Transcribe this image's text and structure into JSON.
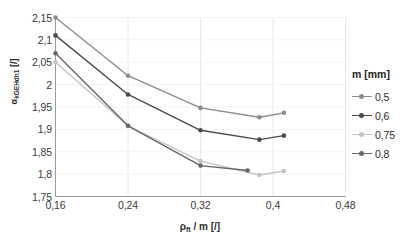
{
  "chart_data": {
    "type": "line",
    "title": "",
    "xlabel": "ρft / m [/]",
    "xlabel_base": "ρ",
    "xlabel_sub": "ft",
    "xlabel_rest": " / m [/]",
    "ylabel": "αkGEHdh1 [/]",
    "ylabel_base": "α",
    "ylabel_sub": "kGEHdh1",
    "ylabel_rest": " [/]",
    "xlim": [
      0.16,
      0.48
    ],
    "ylim": [
      1.75,
      2.15
    ],
    "xticks": [
      0.16,
      0.24,
      0.32,
      0.4,
      0.48
    ],
    "xtick_labels": [
      "0,16",
      "0,24",
      "0,32",
      "0,4",
      "0,48"
    ],
    "yticks": [
      1.75,
      1.8,
      1.85,
      1.9,
      1.95,
      2.0,
      2.05,
      2.1,
      2.15
    ],
    "ytick_labels": [
      "1,75",
      "1,8",
      "1,85",
      "1,9",
      "1,95",
      "2",
      "2,05",
      "2,1",
      "2,15"
    ],
    "grid": true,
    "grid_color": "#e8e8e8",
    "legend_position": "right",
    "legend_title": "m [mm]",
    "series": [
      {
        "name": "0,5",
        "color": "#8c8c8c",
        "x": [
          0.16,
          0.24,
          0.32,
          0.385,
          0.412
        ],
        "y": [
          2.15,
          2.02,
          1.948,
          1.927,
          1.937
        ]
      },
      {
        "name": "0,6",
        "color": "#4a4a4a",
        "x": [
          0.16,
          0.24,
          0.32,
          0.385,
          0.412
        ],
        "y": [
          2.11,
          1.978,
          1.898,
          1.877,
          1.886
        ]
      },
      {
        "name": "0,75",
        "color": "#c4c4c4",
        "x": [
          0.16,
          0.24,
          0.32,
          0.385,
          0.412
        ],
        "y": [
          2.05,
          1.908,
          1.829,
          1.798,
          1.807
        ]
      },
      {
        "name": "0,8",
        "color": "#666666",
        "x": [
          0.16,
          0.24,
          0.32,
          0.372
        ],
        "y": [
          2.07,
          1.908,
          1.819,
          1.808
        ]
      }
    ]
  }
}
